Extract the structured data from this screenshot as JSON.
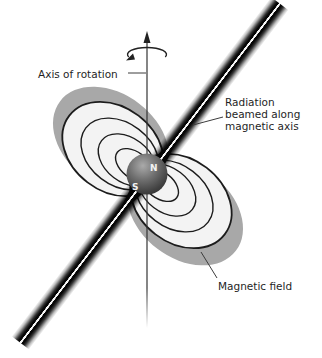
{
  "diagram": {
    "labels": {
      "axis_of_rotation": "Axis of rotation",
      "radiation": [
        "Radiation",
        "beamed along",
        "magnetic axis"
      ],
      "magnetic_field": "Magnetic field",
      "pole_n": "N",
      "pole_s": "S"
    },
    "colors": {
      "background": "#ffffff",
      "lobe_gray": "#a8a8a8",
      "field_region_fill": "#f3f3f3",
      "field_line": "#1c1c1c",
      "beam_dark": "#0a0a0a",
      "beam_core": "#f8f8f8",
      "axis_line": "#333333",
      "text": "#1f1f1f",
      "sphere_highlight": "#aaaaaa",
      "sphere_shadow": "#282828",
      "pole_text": "#f2f2f2"
    }
  }
}
